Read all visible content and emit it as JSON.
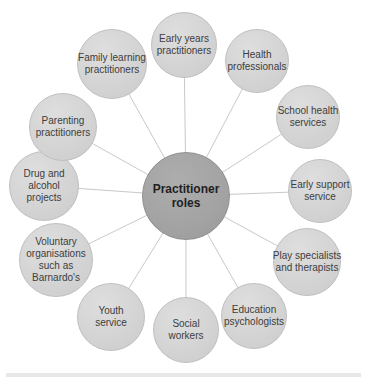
{
  "diagram": {
    "title": "Practitioner roles",
    "hub": {
      "label": "Practitioner\nroles"
    },
    "nodes": [
      {
        "id": "early-years-practitioners",
        "label": "Early years\npractitioners"
      },
      {
        "id": "health-professionals",
        "label": "Health\nprofessionals"
      },
      {
        "id": "school-health-services",
        "label": "School health\nservices"
      },
      {
        "id": "early-support-service",
        "label": "Early support\nservice"
      },
      {
        "id": "play-specialists-and-therapists",
        "label": "Play specialists\nand therapists"
      },
      {
        "id": "education-psychologists",
        "label": "Education\npsychologists"
      },
      {
        "id": "social-workers",
        "label": "Social\nworkers"
      },
      {
        "id": "youth-service",
        "label": "Youth\nservice"
      },
      {
        "id": "voluntary-organisations",
        "label": "Voluntary\norganisations\nsuch as\nBarnardo's"
      },
      {
        "id": "drug-and-alcohol-projects",
        "label": "Drug and\nalcohol\nprojects"
      },
      {
        "id": "parenting-practitioners",
        "label": "Parenting\npractitioners"
      },
      {
        "id": "family-learning-practitioners",
        "label": "Family learning\npractitioners"
      }
    ],
    "colors": {
      "node_fill": "#d4d4d4",
      "node_edge": "#bfbfbf",
      "hub_fill": "#a3a3a3",
      "hub_edge": "#8f8f8f",
      "spoke": "#c9c9c9",
      "node_text": "#3d3d3d",
      "hub_text": "#1f1f1f",
      "bottom_rule": "#e7e7e7"
    }
  }
}
